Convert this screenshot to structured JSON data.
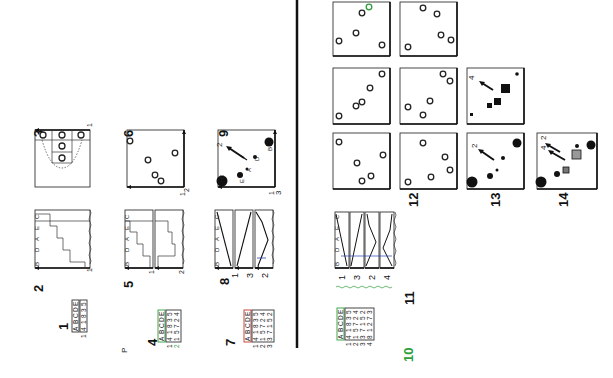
{
  "figure": {
    "orientation": "rotated 90 degrees clockwise",
    "panel_labels": [
      "1",
      "2",
      "3",
      "4",
      "5",
      "6",
      "7",
      "8",
      "9",
      "10",
      "11",
      "12",
      "13",
      "14"
    ],
    "stray_label": "P",
    "tables": {
      "t1": {
        "header": [
          "A",
          "B",
          "C",
          "D",
          "E"
        ],
        "rows": [
          {
            "id": "1",
            "cells": [
              "4",
              "1",
              "8",
              "3",
              "5"
            ]
          }
        ]
      },
      "t4": {
        "header": [
          "A",
          "B",
          "C",
          "D",
          "E"
        ],
        "rows": [
          {
            "id": "1",
            "cells": [
              "4",
              "1",
              "8",
              "3",
              "5"
            ]
          },
          {
            "id": "2",
            "cells": [
              "1",
              "5",
              "7",
              "2",
              "4"
            ]
          }
        ]
      },
      "t7": {
        "header": [
          "A",
          "B",
          "C",
          "D",
          "E"
        ],
        "rows": [
          {
            "id": "1",
            "cells": [
              "4",
              "1",
              "8",
              "3",
              "5"
            ]
          },
          {
            "id": "2",
            "cells": [
              "1",
              "5",
              "7",
              "2",
              "4"
            ]
          },
          {
            "id": "3",
            "cells": [
              "3",
              "7",
              "1",
              "5",
              "2"
            ]
          }
        ]
      },
      "t10": {
        "header": [
          "A",
          "B",
          "C",
          "D",
          "E"
        ],
        "rows": [
          {
            "id": "1",
            "cells": [
              "4",
              "1",
              "8",
              "3",
              "5"
            ]
          },
          {
            "id": "2",
            "cells": [
              "1",
              "5",
              "7",
              "2",
              "4"
            ]
          },
          {
            "id": "3",
            "cells": [
              "3",
              "7",
              "1",
              "5",
              "2"
            ]
          },
          {
            "id": "4",
            "cells": [
              "8",
              "1",
              "2",
              "7",
              "3"
            ]
          }
        ]
      }
    },
    "bar_axis_letters": [
      "B",
      "D",
      "A",
      "E",
      "C"
    ],
    "axis_numbers": {
      "p2": "1",
      "p3_x": "1",
      "p3_y": "3",
      "p5": [
        "1",
        "2"
      ],
      "p6_x": "1",
      "p6_y": "2",
      "p8": [
        "1",
        "3",
        "2"
      ],
      "p9_x": "1",
      "p9_y": "3",
      "p9_arrow": "2",
      "p11": [
        "1",
        "3",
        "2",
        "4"
      ]
    },
    "scatter_letters": [
      "A",
      "B",
      "C",
      "D",
      "E"
    ],
    "grid_axis_numbers": {
      "r1c1": [
        "1",
        "4"
      ],
      "r1c2": [
        "3",
        "4"
      ],
      "r2c1": [
        "1",
        "3"
      ],
      "r2c2": [
        "2",
        "3"
      ],
      "r2c3": [
        "1",
        "3"
      ],
      "r2c3_arrow": "4",
      "r3c1": [
        "1",
        "2"
      ],
      "r3c2": [
        "2",
        "1"
      ],
      "r3c3": [
        "1",
        "3"
      ],
      "r3c3_arrow": "2",
      "r3c4": [
        "1",
        "3"
      ],
      "r3c4_arrows": [
        "4",
        "2"
      ]
    },
    "colors": {
      "ink": "#111111",
      "green": "#2e9e3a",
      "red": "#c0392b",
      "blue": "#2a3fb0"
    }
  }
}
